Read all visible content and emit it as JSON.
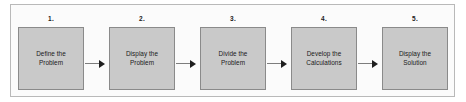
{
  "diagram": {
    "type": "flowchart",
    "orientation": "horizontal",
    "frame_color": "#b9b9b9",
    "box_fill": "#c9c9c9",
    "box_border": "#8a8a8a",
    "arrow_color": "#1e1e1e",
    "steps": [
      {
        "number": "1.",
        "label": "Define the\nProblem",
        "line1": "Define the",
        "line2": "Problem"
      },
      {
        "number": "2.",
        "label": "Display the\nProblem",
        "line1": "Display the",
        "line2": "Problem"
      },
      {
        "number": "3.",
        "label": "Divide the\nProblem",
        "line1": "Divide the",
        "line2": "Problem"
      },
      {
        "number": "4.",
        "label": "Develop the\nCalculations",
        "line1": "Develop the",
        "line2": "Calculations"
      },
      {
        "number": "5.",
        "label": "Display the\nSolution",
        "line1": "Display the",
        "line2": "Solution"
      }
    ],
    "connectors": [
      {
        "from": "1",
        "to": "2",
        "icon": "arrow-right-icon"
      },
      {
        "from": "2",
        "to": "3",
        "icon": "arrow-right-icon"
      },
      {
        "from": "3",
        "to": "4",
        "icon": "arrow-right-icon"
      },
      {
        "from": "4",
        "to": "5",
        "icon": "arrow-right-icon"
      }
    ]
  }
}
